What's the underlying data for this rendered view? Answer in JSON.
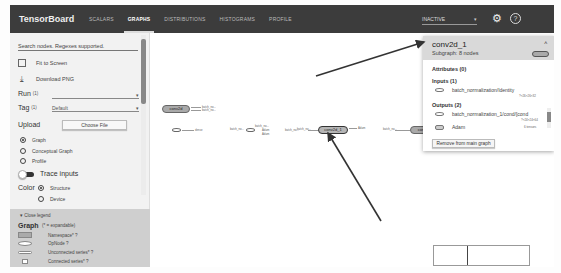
{
  "topbar": {
    "brand": "TensorBoard",
    "tabs": [
      {
        "label": "SCALARS",
        "active": false
      },
      {
        "label": "GRAPHS",
        "active": true
      },
      {
        "label": "DISTRIBUTIONS",
        "active": false
      },
      {
        "label": "HISTOGRAMS",
        "active": false
      },
      {
        "label": "PROFILE",
        "active": false
      }
    ],
    "run_status": "INACTIVE",
    "settings_icon": "gear-icon",
    "help_icon": "help-icon"
  },
  "sidebar": {
    "search_placeholder": "Search nodes. Regexes supported.",
    "fit_to_screen": "Fit to Screen",
    "download_png": "Download PNG",
    "run_label": "Run",
    "run_count": "(1)",
    "run_value": "",
    "tag_label": "Tag",
    "tag_count": "(1)",
    "tag_value": "Default",
    "upload_label": "Upload",
    "choose_file": "Choose File",
    "graph_types": [
      {
        "label": "Graph",
        "selected": true
      },
      {
        "label": "Conceptual Graph",
        "selected": false
      },
      {
        "label": "Profile",
        "selected": false
      }
    ],
    "trace_inputs": "Trace inputs",
    "color_label": "Color",
    "color_options": [
      {
        "label": "Structure",
        "selected": true
      },
      {
        "label": "Device",
        "selected": false
      }
    ],
    "legend": {
      "toggle": "Close legend",
      "title": "Graph",
      "subtitle": "(* = expandable)",
      "items": [
        {
          "label": "Namespace* ?"
        },
        {
          "label": "OpNode ?"
        },
        {
          "label": "Unconnected series* ?"
        },
        {
          "label": "Connected series* ?"
        }
      ]
    }
  },
  "graph": {
    "nodes": [
      {
        "label": "conv2d",
        "type": "namespace"
      },
      {
        "label": "conv2d_1",
        "type": "namespace",
        "selected": true
      },
      {
        "label": "conv2d_2",
        "type": "namespace"
      }
    ],
    "edge_labels": [
      "batch_no...",
      "batch_no...",
      "batch_no...",
      "batch_no...",
      "dense",
      "Adam",
      "Adam",
      "batch_no...",
      "Adam",
      "batch_no..."
    ]
  },
  "info_card": {
    "title": "conv2d_1",
    "subtitle": "Subgraph: 8 nodes",
    "attributes": "Attributes (0)",
    "inputs_header": "Inputs (1)",
    "inputs": [
      {
        "name": "batch_normalization/Identity",
        "shape": "?×26×26×32"
      }
    ],
    "outputs_header": "Outputs (2)",
    "outputs": [
      {
        "name": "batch_normalization_1/cond/[cond",
        "shape": "?×24×24×64"
      },
      {
        "name": "Adam",
        "shape": "6 tensors"
      }
    ],
    "remove_button": "Remove from main graph"
  }
}
